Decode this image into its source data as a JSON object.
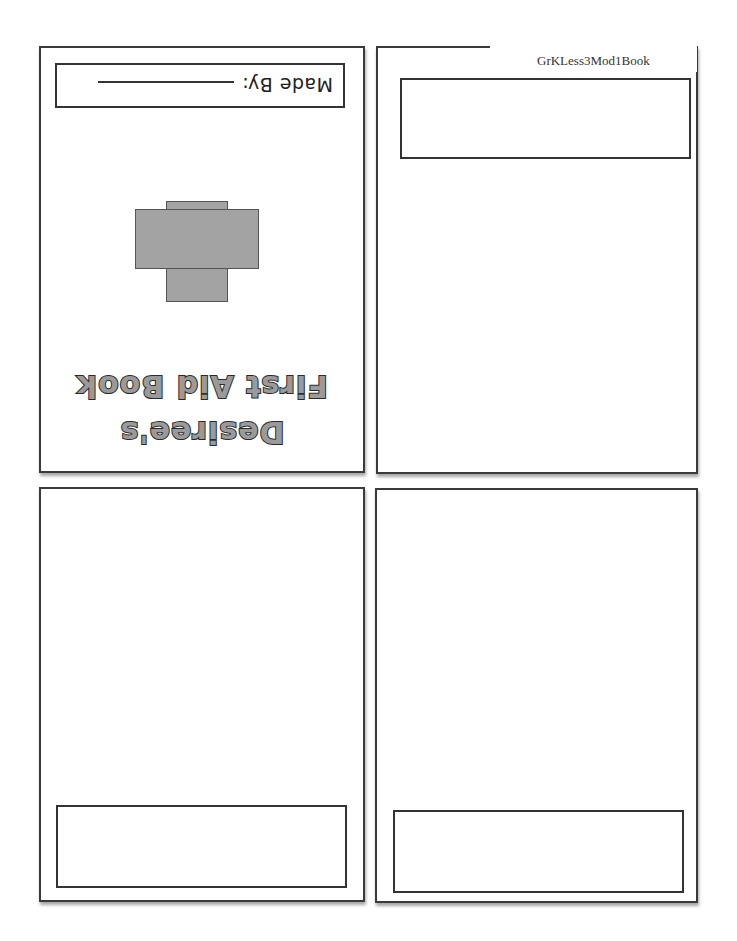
{
  "header": {
    "doc_label": "GrKLess3Mod1Book"
  },
  "cover": {
    "made_by_label": "Made By:",
    "title_line1": "Desiree's",
    "title_line2": "First Aid Book",
    "icon": "first-aid-cross-icon",
    "cross_color": "#a3a3a3"
  },
  "pages": [
    {
      "id": "page-cover",
      "orientation": "upside-down"
    },
    {
      "id": "page-2",
      "text_box": ""
    },
    {
      "id": "page-3",
      "text_box": ""
    },
    {
      "id": "page-4",
      "text_box": ""
    }
  ]
}
